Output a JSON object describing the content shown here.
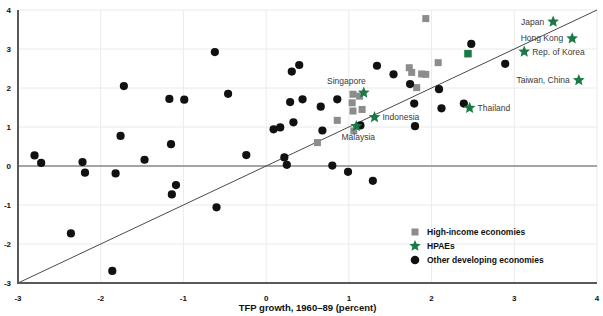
{
  "chart_data": {
    "type": "scatter",
    "title": "",
    "xlabel": "TFP growth, 1960–89 (percent)",
    "ylabel": "",
    "xlim": [
      -3,
      4
    ],
    "ylim": [
      -3,
      4
    ],
    "xticks": [
      -3,
      -2,
      -1,
      0,
      1,
      2,
      3,
      4
    ],
    "xtick_labels": [
      "-3",
      "-2",
      "-1",
      "0",
      "1",
      "2",
      "3",
      "4"
    ],
    "yticks": [
      -3,
      -2,
      -1,
      0,
      1,
      2,
      3,
      4
    ],
    "ytick_labels": [
      "-3",
      "-2",
      "-1",
      "0",
      "1",
      "2",
      "3",
      "4"
    ],
    "grid": true,
    "legend_position": "lower right",
    "reference_lines": [
      {
        "name": "identity-line",
        "type": "diagonal",
        "from": [
          -3,
          -3
        ],
        "to": [
          4,
          4
        ]
      },
      {
        "name": "zero-line",
        "type": "horizontal",
        "y": 0
      }
    ],
    "series": [
      {
        "name": "High-income economies",
        "marker": "square",
        "color": "#8c8c8c",
        "points": [
          {
            "x": 1.93,
            "y": 3.78
          },
          {
            "x": 2.08,
            "y": 2.65
          },
          {
            "x": 1.73,
            "y": 2.52
          },
          {
            "x": 1.76,
            "y": 2.4
          },
          {
            "x": 1.88,
            "y": 2.36
          },
          {
            "x": 1.93,
            "y": 2.35
          },
          {
            "x": 1.82,
            "y": 2.01
          },
          {
            "x": 1.05,
            "y": 1.84
          },
          {
            "x": 1.13,
            "y": 1.79
          },
          {
            "x": 1.04,
            "y": 1.62
          },
          {
            "x": 1.05,
            "y": 1.41
          },
          {
            "x": 1.16,
            "y": 1.45
          },
          {
            "x": 0.86,
            "y": 1.17
          },
          {
            "x": 1.06,
            "y": 0.9
          },
          {
            "x": 0.62,
            "y": 0.6
          }
        ]
      },
      {
        "name": "HPAEs",
        "marker": "star",
        "color": "#1a7a46",
        "points": [
          {
            "x": 3.47,
            "y": 3.7,
            "label": "Japan",
            "label_side": "left"
          },
          {
            "x": 3.7,
            "y": 3.27,
            "label": "Hong Kong",
            "label_side": "left"
          },
          {
            "x": 3.12,
            "y": 2.93,
            "label": "Rep. of Korea",
            "label_side": "right"
          },
          {
            "x": 3.78,
            "y": 2.2,
            "label": "Taiwan, China",
            "label_side": "left"
          },
          {
            "x": 2.46,
            "y": 1.49,
            "label": "Thailand",
            "label_side": "right"
          },
          {
            "x": 1.18,
            "y": 1.88,
            "label": "Singapore",
            "label_side": "upper-left"
          },
          {
            "x": 1.31,
            "y": 1.25,
            "label": "Indonesia",
            "label_side": "right"
          },
          {
            "x": 1.09,
            "y": 1.02,
            "label": "Malaysia",
            "label_side": "below"
          }
        ],
        "extra_marker": {
          "x": 2.44,
          "y": 2.88,
          "marker": "square",
          "note": "green-square"
        }
      },
      {
        "name": "Other developing economies",
        "marker": "circle",
        "color": "#111111",
        "points": [
          {
            "x": -2.8,
            "y": 0.27
          },
          {
            "x": -2.72,
            "y": 0.08
          },
          {
            "x": -2.36,
            "y": -1.73
          },
          {
            "x": -2.22,
            "y": 0.1
          },
          {
            "x": -2.19,
            "y": -0.17
          },
          {
            "x": -1.86,
            "y": -2.69
          },
          {
            "x": -1.82,
            "y": -0.19
          },
          {
            "x": -1.76,
            "y": 0.77
          },
          {
            "x": -1.72,
            "y": 2.05
          },
          {
            "x": -1.47,
            "y": 0.16
          },
          {
            "x": -1.17,
            "y": 1.72
          },
          {
            "x": -1.15,
            "y": 0.56
          },
          {
            "x": -1.14,
            "y": -0.73
          },
          {
            "x": -1.09,
            "y": -0.49
          },
          {
            "x": -0.99,
            "y": 1.7
          },
          {
            "x": -0.62,
            "y": 2.92
          },
          {
            "x": -0.6,
            "y": -1.06
          },
          {
            "x": -0.46,
            "y": 1.85
          },
          {
            "x": -0.24,
            "y": 0.28
          },
          {
            "x": 0.09,
            "y": 0.94
          },
          {
            "x": 0.17,
            "y": 0.99
          },
          {
            "x": 0.22,
            "y": 0.22
          },
          {
            "x": 0.25,
            "y": 0.03
          },
          {
            "x": 0.29,
            "y": 1.64
          },
          {
            "x": 0.31,
            "y": 2.42
          },
          {
            "x": 0.33,
            "y": 1.12
          },
          {
            "x": 0.4,
            "y": 2.59
          },
          {
            "x": 0.44,
            "y": 1.71
          },
          {
            "x": 0.66,
            "y": 1.52
          },
          {
            "x": 0.68,
            "y": 0.91
          },
          {
            "x": 0.8,
            "y": 0.01
          },
          {
            "x": 0.86,
            "y": 1.71
          },
          {
            "x": 0.99,
            "y": -0.15
          },
          {
            "x": 1.14,
            "y": 1.04
          },
          {
            "x": 1.29,
            "y": -0.38
          },
          {
            "x": 1.34,
            "y": 2.57
          },
          {
            "x": 1.54,
            "y": 2.35
          },
          {
            "x": 1.74,
            "y": 2.1
          },
          {
            "x": 1.79,
            "y": 1.6
          },
          {
            "x": 1.8,
            "y": 1.02
          },
          {
            "x": 2.09,
            "y": 1.97
          },
          {
            "x": 2.12,
            "y": 1.48
          },
          {
            "x": 2.39,
            "y": 1.6
          },
          {
            "x": 2.48,
            "y": 3.13
          },
          {
            "x": 2.89,
            "y": 2.62
          }
        ]
      }
    ]
  },
  "legend": {
    "items": [
      {
        "label": "High-income economies",
        "marker": "square",
        "color": "#8c8c8c"
      },
      {
        "label": "HPAEs",
        "marker": "star",
        "color": "#1a7a46"
      },
      {
        "label": "Other developing economies",
        "marker": "circle",
        "color": "#111111"
      }
    ]
  },
  "axis": {
    "x_title": "TFP growth, 1960–89 (percent)"
  }
}
